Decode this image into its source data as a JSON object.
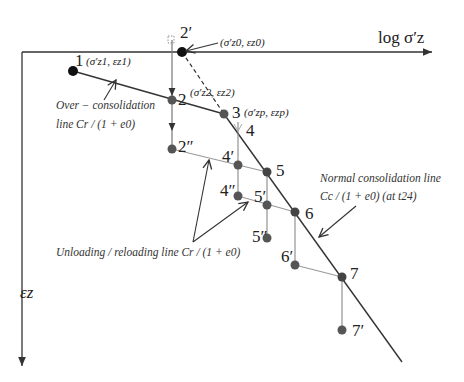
{
  "diagram": {
    "x_axis_label": "log σ′z",
    "y_axis_label": "εz",
    "points": [
      {
        "id": "1",
        "label": "1",
        "coord_label": "(σ′z1, εz1)"
      },
      {
        "id": "2p",
        "label": "2′",
        "coord_label": "(σ′z0, εz0)"
      },
      {
        "id": "2",
        "label": "2",
        "coord_label": "(σ′z2, εz2)"
      },
      {
        "id": "3",
        "label": "3",
        "coord_label": "(σ′zp, εzp)"
      },
      {
        "id": "4",
        "label": "4",
        "coord_label": ""
      },
      {
        "id": "2pp",
        "label": "2″",
        "coord_label": ""
      },
      {
        "id": "4p",
        "label": "4′",
        "coord_label": ""
      },
      {
        "id": "5",
        "label": "5",
        "coord_label": ""
      },
      {
        "id": "4pp",
        "label": "4″",
        "coord_label": ""
      },
      {
        "id": "5p",
        "label": "5′",
        "coord_label": ""
      },
      {
        "id": "6",
        "label": "6",
        "coord_label": ""
      },
      {
        "id": "5pp",
        "label": "5″",
        "coord_label": ""
      },
      {
        "id": "6p",
        "label": "6′",
        "coord_label": ""
      },
      {
        "id": "7",
        "label": "7",
        "coord_label": ""
      },
      {
        "id": "7p",
        "label": "7′",
        "coord_label": ""
      }
    ],
    "annotations": {
      "over_consolidation_1": "Over − consolidation",
      "over_consolidation_2": "line Cr / (1 + e0)",
      "normal_consolidation_1": "Normal consolidation line",
      "normal_consolidation_2": "Cc / (1 + e0)  (at t24)",
      "unloading_reloading": "Unloading / reloading line Cr / (1 + e0)"
    },
    "colors": {
      "black_point": "#111111",
      "gray_point": "#555555",
      "line_dark": "#333333",
      "line_light": "#999999"
    }
  }
}
